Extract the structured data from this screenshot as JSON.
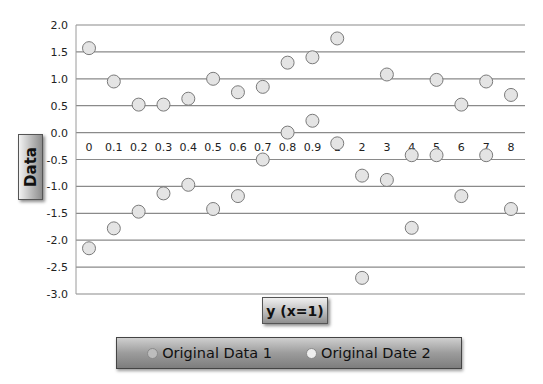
{
  "chart_data": {
    "type": "scatter",
    "title": "",
    "xlabel": "y (x=1)",
    "ylabel": "Data",
    "categories": [
      "0",
      "0.1",
      "0.2",
      "0.3",
      "0.4",
      "0.5",
      "0.6",
      "0.7",
      "0.8",
      "0.9",
      "1",
      "2",
      "3",
      "4",
      "5",
      "6",
      "7",
      "8"
    ],
    "yticks": [
      "2.0",
      "1.5",
      "1.0",
      "0.5",
      "0.0",
      "-0.5",
      "-1.0",
      "-1.5",
      "-2.0",
      "-2.5",
      "-3.0"
    ],
    "ylim": [
      -3.0,
      2.0
    ],
    "grid": true,
    "legend_position": "bottom",
    "series": [
      {
        "name": "Original Data 1",
        "values": [
          1.57,
          0.95,
          0.52,
          0.52,
          0.63,
          1.0,
          0.75,
          0.85,
          1.3,
          1.4,
          1.75,
          -0.8,
          1.08,
          -0.42,
          0.98,
          0.52,
          0.95,
          0.7
        ],
        "marker_color": "#e4e4e4"
      },
      {
        "name": "Original Date 2",
        "values": [
          -2.15,
          -1.78,
          -1.47,
          -1.13,
          -0.97,
          -1.42,
          -1.18,
          -0.5,
          0.0,
          0.22,
          -0.2,
          -2.7,
          -0.88,
          -1.77,
          -0.42,
          -1.18,
          -0.42,
          -1.42
        ],
        "marker_color": "#e4e4e4"
      }
    ]
  },
  "axis": {
    "ylabel": "Data",
    "xlabel": "y  (x=1)"
  },
  "legend": {
    "items": [
      {
        "label": "Original Data 1",
        "color": "#bdbdbd"
      },
      {
        "label": "Original Date 2",
        "color": "#e6e6e6"
      }
    ]
  }
}
